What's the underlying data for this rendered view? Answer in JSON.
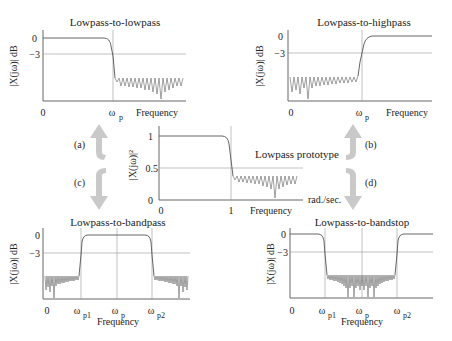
{
  "diagram": {
    "center": {
      "title": "Lowpass prototype",
      "ylabel": "|X(jω)|²",
      "xlabel": "Frequency",
      "unit": "rad./sec.",
      "yticks": [
        "1",
        "0.5",
        "0"
      ],
      "xticks": [
        "0",
        "1"
      ]
    },
    "panels": [
      {
        "id": "a",
        "title": "Lowpass-to-lowpass",
        "ylabel": "|X(jω)| dB",
        "yticks": [
          "0",
          "−3"
        ],
        "xticks": [
          "0",
          "ω",
          "p"
        ],
        "xlabel": "Frequency",
        "arrow_label": "(a)"
      },
      {
        "id": "b",
        "title": "Lowpass-to-highpass",
        "ylabel": "|X(jω)| dB",
        "yticks": [
          "0",
          "−3"
        ],
        "xticks": [
          "0",
          "ω",
          "p"
        ],
        "xlabel": "Frequency",
        "arrow_label": "(b)"
      },
      {
        "id": "c",
        "title": "Lowpass-to-bandpass",
        "ylabel": "|X(jω)| dB",
        "yticks": [
          "0",
          "−3"
        ],
        "xticks": [
          "0",
          "ω",
          "p1",
          "ω",
          "p",
          "ω",
          "p2"
        ],
        "xlabel": "Frequency",
        "arrow_label": "(c)"
      },
      {
        "id": "d",
        "title": "Lowpass-to-bandstop",
        "ylabel": "|X(jω)| dB",
        "yticks": [
          "0",
          "−3"
        ],
        "xticks": [
          "0",
          "ω",
          "p1",
          "ω",
          "p",
          "ω",
          "p2"
        ],
        "xlabel": "Frequency",
        "arrow_label": "(d)"
      }
    ]
  }
}
